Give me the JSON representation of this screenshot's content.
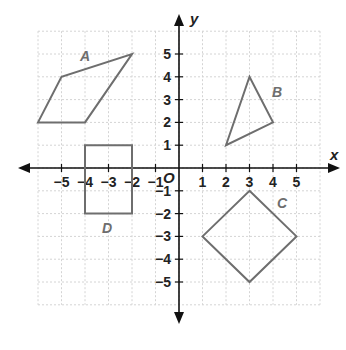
{
  "axes": {
    "x_label": "x",
    "y_label": "y",
    "origin_label": "O",
    "x_ticks": [
      "−5",
      "−4",
      "−3",
      "−2",
      "−1",
      "1",
      "2",
      "3",
      "4",
      "5"
    ],
    "y_ticks": [
      "5",
      "4",
      "3",
      "2",
      "1",
      "−1",
      "−2",
      "−3",
      "−4",
      "−5"
    ],
    "range": {
      "xmin": -6,
      "xmax": 6,
      "ymin": -6,
      "ymax": 6
    }
  },
  "shapes": [
    {
      "label": "A",
      "type": "parallelogram",
      "vertices": [
        [
          -6,
          2
        ],
        [
          -5,
          4
        ],
        [
          -2,
          5
        ],
        [
          -4,
          2
        ]
      ],
      "color": "#6e6e6e"
    },
    {
      "label": "B",
      "type": "triangle",
      "vertices": [
        [
          2,
          1
        ],
        [
          3,
          4
        ],
        [
          4,
          2
        ]
      ],
      "color": "#6e6e6e"
    },
    {
      "label": "C",
      "type": "square",
      "vertices": [
        [
          3,
          -1
        ],
        [
          5,
          -3
        ],
        [
          3,
          -5
        ],
        [
          1,
          -3
        ]
      ],
      "color": "#6e6e6e"
    },
    {
      "label": "D",
      "type": "rectangle",
      "vertices": [
        [
          -4,
          1
        ],
        [
          -2,
          1
        ],
        [
          -2,
          -2
        ],
        [
          -4,
          -2
        ]
      ],
      "color": "#6e6e6e"
    }
  ]
}
